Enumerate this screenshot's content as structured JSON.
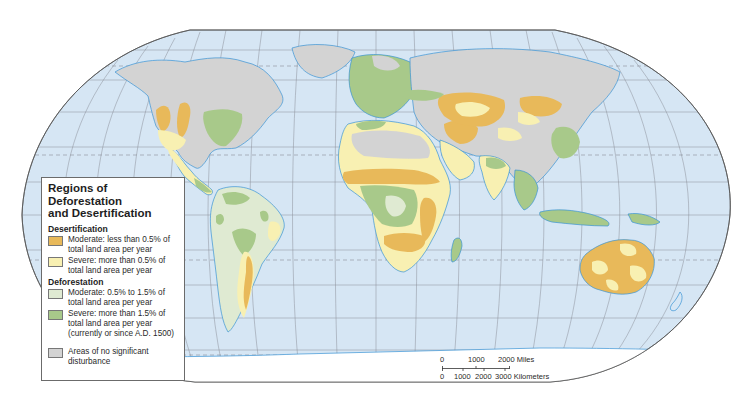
{
  "legend": {
    "title_line1": "Regions of Deforestation",
    "title_line2": "and Desertification",
    "sections": [
      {
        "heading": "Desertification",
        "items": [
          {
            "label_line1": "Moderate:  less than 0.5% of",
            "label_line2": "total land area per year",
            "color": "#e8b95a"
          },
          {
            "label_line1": "Severe:  more than 0.5% of",
            "label_line2": "total land area per year",
            "color": "#f8f0b2"
          }
        ]
      },
      {
        "heading": "Deforestation",
        "items": [
          {
            "label_line1": "Moderate:  0.5% to 1.5% of",
            "label_line2": "total land area per year",
            "color": "#dfead2"
          },
          {
            "label_line1": "Severe:  more than 1.5% of",
            "label_line2": "total land area per year",
            "label_line3": "(currently or since A.D. 1500)",
            "color": "#a8c98a"
          }
        ]
      }
    ],
    "other": {
      "label_line1": "Areas of no significant",
      "label_line2": "disturbance",
      "color": "#d3d3d3"
    }
  },
  "scale_bar": {
    "miles_ticks": [
      "0",
      "1000",
      "2000 Miles"
    ],
    "km_ticks": [
      "0",
      "1000",
      "2000",
      "3000 Kilometers"
    ]
  },
  "colors": {
    "ocean": "#d6e6f4",
    "coastline": "#3a94d6",
    "graticule": "#8a8f99",
    "no_disturbance": "#d3d3d3",
    "desert_moderate": "#e8b95a",
    "desert_severe": "#f8f0b2",
    "deforest_moderate": "#dfead2",
    "deforest_severe": "#a8c98a"
  }
}
